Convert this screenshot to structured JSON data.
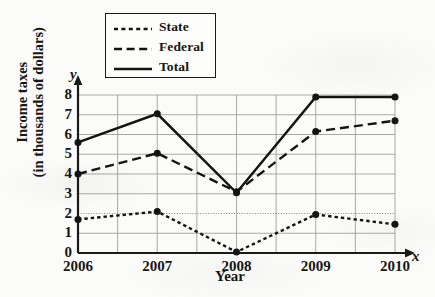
{
  "chart_data": {
    "type": "line",
    "title": "",
    "xlabel": "Year",
    "ylabel_line1": "Income taxes",
    "ylabel_line2": "(in thousands of dollars)",
    "x_axis_variable": "x",
    "y_axis_variable": "y",
    "categories": [
      "2006",
      "2007",
      "2008",
      "2009",
      "2010"
    ],
    "x_tick_labels": [
      "2006",
      "2007",
      "2008",
      "2009",
      "2010"
    ],
    "y_tick_labels": [
      "8",
      "7",
      "6",
      "5",
      "4",
      "3",
      "2",
      "1",
      "0"
    ],
    "xlim": [
      2006,
      2010
    ],
    "ylim": [
      0,
      8
    ],
    "grid": true,
    "grid_detail": "horizontal gridlines at every integer 0-8; vertical gridlines at each year and at each half-year midpoint; the y=2 gridline is drawn as a fine dotted reference line",
    "legend_position": "top-center, boxed",
    "marker": "filled round dot",
    "series": [
      {
        "name": "State",
        "line_style": "dotted",
        "color": "#141414",
        "values": [
          1.7,
          2.1,
          0.05,
          1.95,
          1.45
        ]
      },
      {
        "name": "Federal",
        "line_style": "dashed",
        "color": "#141414",
        "values": [
          4.0,
          5.05,
          3.1,
          6.15,
          6.7
        ]
      },
      {
        "name": "Total",
        "line_style": "solid",
        "color": "#141414",
        "values": [
          5.6,
          7.05,
          3.05,
          7.9,
          7.9
        ]
      }
    ]
  },
  "legend": {
    "entries": [
      {
        "label": "State"
      },
      {
        "label": "Federal"
      },
      {
        "label": "Total"
      }
    ]
  },
  "colors": {
    "ink": "#141414",
    "grid": "#9a9a9a",
    "axis": "#1a1a1a",
    "paper": "#fbfbf9"
  }
}
